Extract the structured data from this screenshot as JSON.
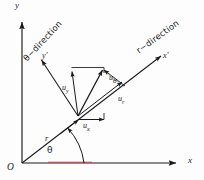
{
  "figure": {
    "background_color": "#fdfdfd",
    "stroke_color": "#1a1a1a",
    "accent_color": "#b24a4a",
    "axes": {
      "x_label": "x",
      "y_label": "y",
      "x_prime_label": "x'",
      "y_prime_label": "y'",
      "origin_label": "O"
    },
    "direction_labels": {
      "theta_direction": "θ−direction",
      "r_direction": "r−direction"
    },
    "polar": {
      "radius_label": "r",
      "angle_label": "θ"
    },
    "vectors": [
      {
        "name": "u-x",
        "symbol": "u",
        "subscript": "x"
      },
      {
        "name": "u-y",
        "symbol": "u",
        "subscript": "y"
      },
      {
        "name": "u-r",
        "symbol": "u",
        "subscript": "r"
      },
      {
        "name": "u-theta",
        "symbol": "u",
        "subscript": "θ"
      }
    ],
    "vector_labels": {
      "ux": "u",
      "ux_sub": "x",
      "uy": "u",
      "uy_sub": "y",
      "ur": "u",
      "ur_sub": "r",
      "utheta": "u",
      "utheta_sub": "θ"
    }
  }
}
